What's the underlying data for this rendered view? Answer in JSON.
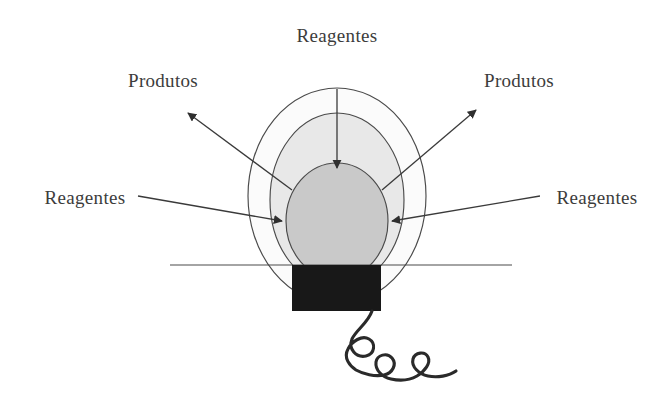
{
  "figure": {
    "type": "diagram",
    "background_color": "#ffffff"
  },
  "labels": {
    "top": "Reagentes",
    "product_left": "Produtos",
    "product_right": "Produtos",
    "reagent_left": "Reagentes",
    "reagent_right": "Reagentes"
  },
  "zones": {
    "outer": {
      "name": "outer-zone",
      "fill": "#fbfbfb",
      "stroke": "#4a4a4a",
      "cx": 337,
      "cy": 196,
      "rx": 89,
      "ry": 108
    },
    "middle": {
      "name": "middle-zone",
      "fill": "#e8e8e8",
      "stroke": "#4a4a4a",
      "cx": 337,
      "cy": 200,
      "rx": 67,
      "ry": 87
    },
    "inner": {
      "name": "inner-core-zone",
      "fill": "#c9c9c9",
      "stroke": "#4a4a4a",
      "cx": 337,
      "cy": 221,
      "rx": 51,
      "ry": 58
    }
  },
  "baseline": {
    "name": "burner-baseline",
    "x1": 170,
    "x2": 512,
    "y": 265,
    "stroke": "#4a4a4a"
  },
  "burner": {
    "name": "burner-block",
    "fill": "#181818",
    "x": 292,
    "y": 265,
    "width": 89,
    "height": 46
  },
  "cable": {
    "name": "coiled-gas-hose",
    "stroke": "#2a2a2a",
    "loops": 3
  },
  "arrows": {
    "stroke": "#3a3a3a",
    "items": [
      {
        "name": "arrow-reagent-top",
        "direction": "inward-down",
        "label_key": "top"
      },
      {
        "name": "arrow-product-left",
        "direction": "outward-upleft",
        "label_key": "product_left"
      },
      {
        "name": "arrow-product-right",
        "direction": "outward-upright",
        "label_key": "product_right"
      },
      {
        "name": "arrow-reagent-left",
        "direction": "inward-right",
        "label_key": "reagent_left"
      },
      {
        "name": "arrow-reagent-right",
        "direction": "inward-left",
        "label_key": "reagent_right"
      }
    ]
  }
}
